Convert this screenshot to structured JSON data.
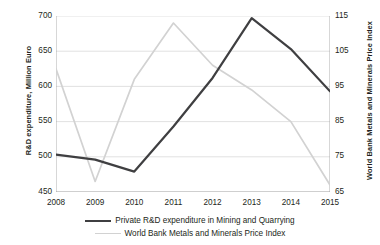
{
  "chart_data": {
    "type": "line",
    "title": "",
    "xlabel": "",
    "categories": [
      "2008",
      "2009",
      "2010",
      "2011",
      "2012",
      "2013",
      "2014",
      "2015"
    ],
    "grid": true,
    "legend_position": "bottom",
    "axes": {
      "left": {
        "label": "R&D expenditure, Million Euro",
        "ticks": [
          "450",
          "500",
          "550",
          "600",
          "650",
          "700"
        ],
        "ylim": [
          450,
          700
        ]
      },
      "right": {
        "label": "World Bank Metals and Minerals Price Index",
        "ticks": [
          "65",
          "75",
          "85",
          "95",
          "105",
          "115"
        ],
        "ylim": [
          65,
          115
        ]
      }
    },
    "series": [
      {
        "name": "Private R&D expenditure in Mining and Quarrying",
        "axis": "left",
        "color": "#3f3f41",
        "values": [
          503,
          496,
          479,
          543,
          612,
          697,
          653,
          593
        ]
      },
      {
        "name": "World Bank Metals and Minerals Price Index",
        "axis": "right",
        "color": "#d2d2d2",
        "values": [
          100,
          68,
          97,
          113,
          101,
          94,
          85,
          67
        ]
      }
    ]
  },
  "legend": {
    "items": [
      {
        "label": "Private R&D expenditure in Mining and Quarrying",
        "swatch": "dark-line-swatch"
      },
      {
        "label": "World Bank Metals and Minerals Price Index",
        "swatch": "light-line-swatch"
      }
    ]
  }
}
